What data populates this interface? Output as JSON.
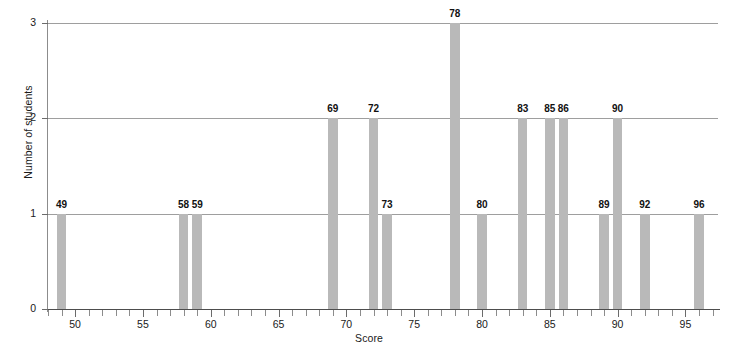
{
  "chart_data": {
    "type": "bar",
    "title": "",
    "subtitle": "",
    "xlabel": "Score",
    "ylabel": "Number of students",
    "xlim": [
      48.0,
      97.4
    ],
    "ylim": [
      0,
      3
    ],
    "grid": true,
    "legend": null,
    "x_major_ticks": [
      50,
      55,
      60,
      65,
      70,
      75,
      80,
      85,
      90,
      95
    ],
    "x_minor_tick_step": 1,
    "y_ticks": [
      0,
      1,
      2,
      3
    ],
    "y_tick_labels": [
      "0",
      "1",
      "2",
      "3"
    ],
    "bar_color": "#b9b9b9",
    "gridline_color": "#9e9e9e",
    "axis_color": "#6b6b6b",
    "bar_labels_shown": true,
    "categories": [
      49,
      58,
      59,
      69,
      72,
      73,
      78,
      80,
      83,
      85,
      86,
      89,
      90,
      92,
      96
    ],
    "values": [
      1,
      1,
      1,
      2,
      2,
      1,
      3,
      1,
      2,
      2,
      2,
      1,
      2,
      1,
      1
    ],
    "points": [
      {
        "score": "49",
        "count": 1
      },
      {
        "score": "58",
        "count": 1
      },
      {
        "score": "59",
        "count": 1
      },
      {
        "score": "69",
        "count": 2
      },
      {
        "score": "72",
        "count": 2
      },
      {
        "score": "73",
        "count": 1
      },
      {
        "score": "78",
        "count": 3
      },
      {
        "score": "80",
        "count": 1
      },
      {
        "score": "83",
        "count": 2
      },
      {
        "score": "85",
        "count": 2
      },
      {
        "score": "86",
        "count": 2
      },
      {
        "score": "89",
        "count": 1
      },
      {
        "score": "90",
        "count": 2
      },
      {
        "score": "92",
        "count": 1
      },
      {
        "score": "96",
        "count": 1
      }
    ]
  }
}
